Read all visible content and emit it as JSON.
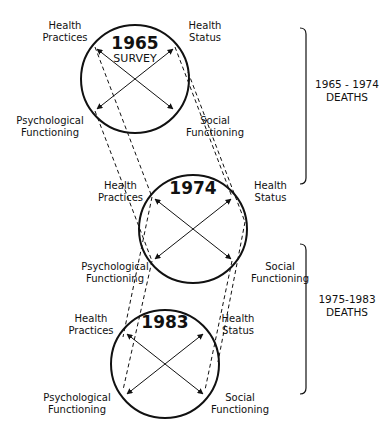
{
  "diagram": {
    "panels": [
      {
        "year": "1965",
        "subtitle": "SURVEY",
        "nodes": {
          "top_left": [
            "Health",
            "Practices"
          ],
          "top_right": [
            "Health",
            "Status"
          ],
          "bottom_left": [
            "Psychological",
            "Functioning"
          ],
          "bottom_right": [
            "Social",
            "Functioning"
          ]
        }
      },
      {
        "year": "1974",
        "subtitle": "",
        "nodes": {
          "top_left": [
            "Health",
            "Practices"
          ],
          "top_right": [
            "Health",
            "Status"
          ],
          "bottom_left": [
            "Psychological",
            "Functioning"
          ],
          "bottom_right": [
            "Social",
            "Functioning"
          ]
        }
      },
      {
        "year": "1983",
        "subtitle": "",
        "nodes": {
          "top_left": [
            "Health",
            "Practices"
          ],
          "top_right": [
            "Health",
            "Status"
          ],
          "bottom_left": [
            "Psychological",
            "Functioning"
          ],
          "bottom_right": [
            "Social",
            "Functioning"
          ]
        }
      }
    ],
    "brackets": [
      {
        "line1": "1965 - 1974",
        "line2": "DEATHS"
      },
      {
        "line1": "1975-1983",
        "line2": "DEATHS"
      }
    ]
  }
}
